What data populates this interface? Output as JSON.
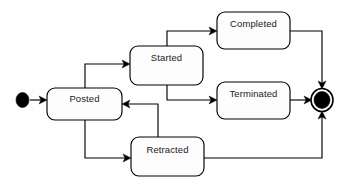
{
  "diagram": {
    "type": "uml-state-machine",
    "title": "",
    "background_color": "#fefefe",
    "line_color": "#000000",
    "box_fill_color": "#fdfdfd",
    "text_color": "#1a1a1a",
    "nodes": [
      {
        "id": "initial",
        "kind": "initial-state",
        "label": "",
        "cx": 22.5,
        "cy": 100,
        "rx": 6.5,
        "ry": 7.5
      },
      {
        "id": "posted",
        "kind": "state",
        "label": "Posted",
        "x": 47,
        "y": 88,
        "w": 75,
        "h": 32,
        "label_x": 84.5,
        "label_y": 99
      },
      {
        "id": "started",
        "kind": "state",
        "label": "Started",
        "x": 130,
        "y": 46,
        "w": 73,
        "h": 39,
        "label_x": 166.5,
        "label_y": 58
      },
      {
        "id": "completed",
        "kind": "state",
        "label": "Completed",
        "x": 217,
        "y": 12,
        "w": 73,
        "h": 37,
        "label_x": 253.5,
        "label_y": 24
      },
      {
        "id": "terminated",
        "kind": "state",
        "label": "Terminated",
        "x": 217,
        "y": 82,
        "w": 73,
        "h": 37,
        "label_x": 253.5,
        "label_y": 94
      },
      {
        "id": "retracted",
        "kind": "state",
        "label": "Retracted",
        "x": 131,
        "y": 137,
        "w": 73,
        "h": 39,
        "label_x": 167.5,
        "label_y": 150
      },
      {
        "id": "final",
        "kind": "final-state",
        "label": "",
        "cx": 322,
        "cy": 100,
        "ring_rx": 11,
        "ring_ry": 11.5,
        "core_rx": 8,
        "core_ry": 8.5
      }
    ],
    "edges": [
      {
        "id": "initial-to-posted",
        "from": "initial",
        "to": "posted",
        "label": "",
        "path": "M 30 100 L 45 100",
        "arrow": {
          "x": 47,
          "y": 100,
          "dir": "right"
        }
      },
      {
        "id": "posted-to-started",
        "from": "posted",
        "to": "started",
        "label": "",
        "path": "M 85 88 L 85 64 L 128 64",
        "arrow": {
          "x": 130,
          "y": 64,
          "dir": "right"
        }
      },
      {
        "id": "started-to-completed",
        "from": "started",
        "to": "completed",
        "label": "",
        "path": "M 167 46 L 167 31 L 215 31",
        "arrow": {
          "x": 217,
          "y": 31,
          "dir": "right"
        }
      },
      {
        "id": "started-to-terminated",
        "from": "started",
        "to": "terminated",
        "label": "",
        "path": "M 167 85 L 167 100 L 215 100",
        "arrow": {
          "x": 217,
          "y": 100,
          "dir": "right"
        }
      },
      {
        "id": "posted-to-retracted",
        "from": "posted",
        "to": "retracted",
        "label": "",
        "path": "M 85 120 L 85 158 L 129 158",
        "arrow": {
          "x": 131,
          "y": 158,
          "dir": "right"
        }
      },
      {
        "id": "retracted-to-posted",
        "from": "retracted",
        "to": "posted",
        "label": "",
        "path": "M 158 137 L 158 104 L 124 104",
        "arrow": {
          "x": 122,
          "y": 104,
          "dir": "left"
        }
      },
      {
        "id": "completed-to-final",
        "from": "completed",
        "to": "final",
        "label": "",
        "path": "M 290 31 L 322 31 L 322 86",
        "arrow": {
          "x": 322,
          "y": 88,
          "dir": "down"
        }
      },
      {
        "id": "terminated-to-final",
        "from": "terminated",
        "to": "final",
        "label": "",
        "path": "M 290 100 L 309 100",
        "arrow": {
          "x": 311,
          "y": 100,
          "dir": "right"
        }
      },
      {
        "id": "retracted-to-final",
        "from": "retracted",
        "to": "final",
        "label": "",
        "path": "M 204 158 L 322 158 L 322 114",
        "arrow": {
          "x": 322,
          "y": 112,
          "dir": "up"
        }
      }
    ]
  }
}
